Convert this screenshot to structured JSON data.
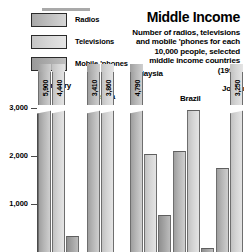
{
  "header": {
    "title": "Middle Income",
    "subtitle_lines": [
      "Number of radios, televisions",
      "and mobile 'phones for each",
      "10,000 people, selected",
      "middle income countries"
    ],
    "year": "(1996)"
  },
  "legend": {
    "items": [
      {
        "label": "Radios",
        "swatch": "radios-swatch",
        "color": "#b4b4b4"
      },
      {
        "label": "Televisions",
        "swatch": "televisions-swatch",
        "color": "#d8d8d8"
      },
      {
        "label": "Mobile 'phones",
        "swatch": "mobile-phones-swatch",
        "color": "#a3a3a3"
      }
    ]
  },
  "chart_data": {
    "type": "bar",
    "title": "Middle Income",
    "subtitle": "Number of radios, televisions and mobile 'phones for each 10,000 people, selected middle income countries (1996)",
    "xlabel": "",
    "ylabel": "",
    "ylim": [
      0,
      3400
    ],
    "yticks": [
      1000,
      2000,
      3000
    ],
    "ytick_labels": [
      "1,000",
      "2,000",
      "3,000"
    ],
    "grid": false,
    "legend_position": "top-left",
    "axis_break": {
      "present": true,
      "note": "Bars exceeding the 3,000 axis maximum are truncated with a pennant cap carrying the true value"
    },
    "categories": [
      "Hungary",
      "Russia",
      "Malaysia",
      "Brazil",
      "Jordan"
    ],
    "series": [
      {
        "name": "Radios",
        "values": [
          5900,
          3410,
          4790,
          2100,
          1750
        ],
        "labels": [
          "5,900",
          "3,410",
          "4,790",
          "",
          ""
        ],
        "truncated": [
          true,
          true,
          true,
          false,
          false
        ]
      },
      {
        "name": "Televisions",
        "values": [
          4440,
          3860,
          2050,
          2950,
          3250
        ],
        "labels": [
          "4,440",
          "3,860",
          "",
          "",
          "3,250"
        ],
        "truncated": [
          true,
          true,
          false,
          false,
          true
        ]
      },
      {
        "name": "Mobile 'phones",
        "values": [
          330,
          0,
          770,
          90,
          0
        ],
        "labels": [
          "",
          "",
          "",
          "",
          ""
        ],
        "truncated": [
          false,
          false,
          false,
          false,
          false
        ]
      }
    ]
  }
}
